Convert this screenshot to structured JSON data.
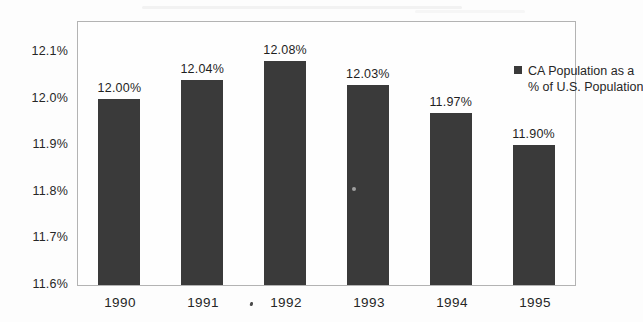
{
  "chart_data": {
    "type": "bar",
    "title": "",
    "xlabel": "",
    "ylabel": "",
    "categories": [
      "1990",
      "1991",
      "1992",
      "1993",
      "1994",
      "1995"
    ],
    "values": [
      12.0,
      12.04,
      12.08,
      12.03,
      11.97,
      11.9
    ],
    "bar_labels": [
      "12.00%",
      "12.04%",
      "12.08%",
      "12.03%",
      "11.97%",
      "11.90%"
    ],
    "ylim": [
      11.6,
      12.1
    ],
    "ytick_interval": 0.1,
    "yticks": [
      {
        "value": 11.6,
        "label": "11.6%"
      },
      {
        "value": 11.7,
        "label": "11.7%"
      },
      {
        "value": 11.8,
        "label": "11.8%"
      },
      {
        "value": 11.9,
        "label": "11.9%"
      },
      {
        "value": 12.0,
        "label": "12.0%"
      },
      {
        "value": 12.1,
        "label": "12.1%"
      }
    ],
    "grid": false,
    "legend": {
      "position": "top-right",
      "marker": "square",
      "lines": [
        "CA Population as a",
        "% of U.S. Population"
      ]
    },
    "colors": {
      "bar": "#3a3a3a",
      "plot_border": "#b3b3b3",
      "text": "#262626",
      "background": "#fdfdfd"
    }
  }
}
